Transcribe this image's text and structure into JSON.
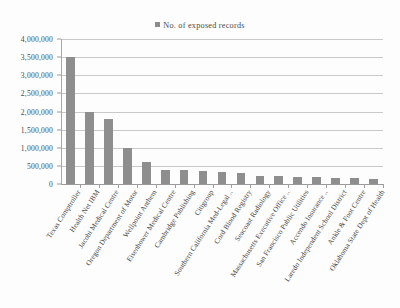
{
  "chart_data": {
    "type": "bar",
    "title": "",
    "subtitle": "",
    "xlabel": "",
    "ylabel": "",
    "ylim": [
      0,
      4000000
    ],
    "grid": true,
    "legend_position": "top-center",
    "legend": [
      "No. of exposed records"
    ],
    "y_ticks": [
      "4,000,000",
      "3,500,000",
      "3,000,000",
      "2,500,000",
      "2,000,000",
      "1,500,000",
      "1,000,000",
      "500,000",
      "0"
    ],
    "y_tick_values": [
      4000000,
      3500000,
      3000000,
      2500000,
      2000000,
      1500000,
      1000000,
      500000,
      0
    ],
    "categories": [
      "Texas Comptroller",
      "Health Net IBM",
      "Jacobi Medical Centre",
      "Oregon Department of Motor",
      "Wellpoint Anthem",
      "Eisenhower Medical Centre",
      "Cambridge Publishing",
      "Citigroup",
      "Southern California Med-Legal ..",
      "Cord Blood Registry",
      "Seacoast Radiology",
      "Massachusetts Executive Office ..",
      "San Francisco Public Utilities",
      "Accendo Insurance ..",
      "Laredo Independent School District",
      "Ankle & Foot Centre",
      "Oklahoma State Dept of Health"
    ],
    "values": [
      3500000,
      2000000,
      1800000,
      1000000,
      600000,
      400000,
      380000,
      360000,
      330000,
      300000,
      230000,
      210000,
      185000,
      180000,
      175000,
      155000,
      150000
    ],
    "series": [
      {
        "name": "No. of exposed records",
        "color": "#8e8e8e",
        "values": [
          3500000,
          2000000,
          1800000,
          1000000,
          600000,
          400000,
          380000,
          360000,
          330000,
          300000,
          230000,
          210000,
          185000,
          180000,
          175000,
          155000,
          150000
        ]
      }
    ]
  },
  "colors": {
    "bar": "#8e8e8e",
    "gridline": "#c9c9c9",
    "axis": "#9a9a9a",
    "text": "#3f3f3f",
    "background": "#fdfdfd"
  }
}
